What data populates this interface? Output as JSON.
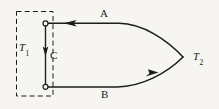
{
  "figure": {
    "type": "thermodynamic-cycle-diagram",
    "width": 219,
    "height": 109,
    "background_color": "#f6f5f2",
    "stroke_color": "#1c1c1c"
  },
  "labels": {
    "path_a": "A",
    "path_b": "B",
    "path_c": "C",
    "reservoir_temperature": "T",
    "reservoir_temperature_sub": "1",
    "apex_temperature": "T",
    "apex_temperature_sub": "2"
  },
  "elements": {
    "dashed_box": {
      "name": "temperature-reservoir-boundary",
      "style": "dashed",
      "x": 16,
      "y": 11,
      "width": 37,
      "height": 85
    },
    "node_top": {
      "name": "state-node-top",
      "cx": 45.5,
      "cy": 23.5,
      "r": 2.6
    },
    "node_bottom": {
      "name": "state-node-bottom",
      "cx": 45.5,
      "cy": 86.5,
      "r": 2.6
    },
    "path_c_line": {
      "from_x": 45.5,
      "from_y": 23.5,
      "to_x": 45.5,
      "to_y": 86.5,
      "arrow": "down"
    },
    "path_a_line": {
      "from_x": 45.5,
      "from_y": 23.5,
      "to_x": 183,
      "to_y": 57,
      "arrow": "left"
    },
    "path_b_line": {
      "from_x": 45.5,
      "from_y": 86.5,
      "to_x": 183,
      "to_y": 57,
      "arrow": "right"
    },
    "apex": {
      "x": 183,
      "y": 57
    }
  }
}
